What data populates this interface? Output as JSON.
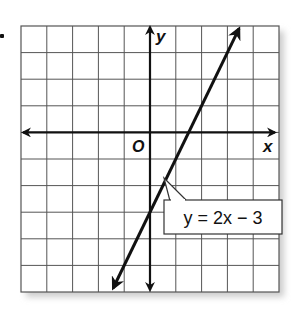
{
  "chart_data": {
    "type": "line",
    "title": "",
    "xlabel": "x",
    "ylabel": "y",
    "origin_label": "O",
    "xlim": [
      -5,
      5
    ],
    "ylim": [
      -6,
      4
    ],
    "grid": true,
    "series": [
      {
        "name": "y = 2x - 3",
        "slope": 2,
        "intercept": -3,
        "points": [
          [
            -1.5,
            -6
          ],
          [
            0,
            -3
          ],
          [
            1.5,
            0
          ],
          [
            3.5,
            4
          ]
        ]
      }
    ],
    "annotations": [
      {
        "text": "y = 2x − 3",
        "points_to": [
          0.5,
          -2
        ]
      }
    ]
  },
  "labels": {
    "x_axis": "x",
    "y_axis": "y",
    "origin": "O",
    "equation": "y = 2x − 3"
  }
}
